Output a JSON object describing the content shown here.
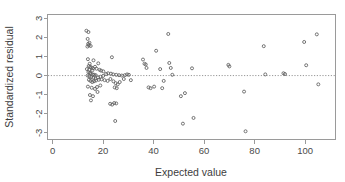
{
  "chart_data": {
    "type": "scatter",
    "title": "",
    "xlabel": "Expected value",
    "ylabel": "Standardized residual",
    "xlim": [
      -2,
      112
    ],
    "ylim": [
      -3.35,
      3.2
    ],
    "xticks": [
      0,
      20,
      40,
      60,
      80,
      100
    ],
    "yticks": [
      -3,
      -2,
      -1,
      0,
      1,
      2,
      3
    ],
    "xtick_labels": [
      "0",
      "20",
      "40",
      "60",
      "80",
      "100"
    ],
    "ytick_labels": [
      "-3",
      "-2",
      "-1",
      "0",
      "1",
      "2",
      "3"
    ],
    "grid": false,
    "legend": null,
    "reference_lines": [
      {
        "name": "zero-residual-line",
        "orientation": "horizontal",
        "y": 0,
        "style": "dotted"
      }
    ],
    "marker": {
      "shape": "open-circle",
      "radius": 1.5,
      "color": "#5d5d5d"
    },
    "points": [
      [
        13.4,
        2.35
      ],
      [
        14.2,
        2.28
      ],
      [
        13.9,
        1.92
      ],
      [
        14.6,
        1.72
      ],
      [
        14.1,
        1.66
      ],
      [
        14.4,
        1.58
      ],
      [
        13.8,
        1.52
      ],
      [
        15.1,
        1.55
      ],
      [
        14.0,
        0.86
      ],
      [
        16.2,
        0.8
      ],
      [
        18.1,
        0.64
      ],
      [
        14.7,
        0.62
      ],
      [
        14.3,
        0.5
      ],
      [
        14.9,
        0.46
      ],
      [
        15.4,
        0.42
      ],
      [
        16.0,
        0.38
      ],
      [
        13.6,
        0.34
      ],
      [
        14.5,
        0.3
      ],
      [
        15.8,
        0.28
      ],
      [
        16.8,
        0.46
      ],
      [
        17.4,
        0.36
      ],
      [
        18.6,
        0.3
      ],
      [
        19.2,
        0.26
      ],
      [
        20.1,
        0.22
      ],
      [
        14.2,
        0.18
      ],
      [
        14.8,
        0.14
      ],
      [
        15.2,
        0.1
      ],
      [
        15.9,
        0.06
      ],
      [
        16.5,
        0.04
      ],
      [
        17.1,
        0.02
      ],
      [
        13.9,
        0.0
      ],
      [
        14.6,
        -0.04
      ],
      [
        15.3,
        -0.08
      ],
      [
        16.1,
        -0.12
      ],
      [
        17.0,
        -0.16
      ],
      [
        18.0,
        -0.1
      ],
      [
        19.0,
        -0.06
      ],
      [
        20.0,
        -0.02
      ],
      [
        21.2,
        0.08
      ],
      [
        22.0,
        0.12
      ],
      [
        23.1,
        0.1
      ],
      [
        24.0,
        0.06
      ],
      [
        25.2,
        0.04
      ],
      [
        26.3,
        0.02
      ],
      [
        27.4,
        0.0
      ],
      [
        28.6,
        0.02
      ],
      [
        29.5,
        0.06
      ],
      [
        30.2,
        0.04
      ],
      [
        14.4,
        -0.22
      ],
      [
        15.0,
        -0.28
      ],
      [
        15.7,
        -0.34
      ],
      [
        16.4,
        -0.3
      ],
      [
        17.2,
        -0.26
      ],
      [
        18.3,
        -0.22
      ],
      [
        19.4,
        -0.2
      ],
      [
        20.6,
        -0.24
      ],
      [
        21.8,
        -0.28
      ],
      [
        22.9,
        -0.18
      ],
      [
        24.1,
        -0.3
      ],
      [
        25.0,
        -0.4
      ],
      [
        25.8,
        -0.46
      ],
      [
        26.6,
        -0.34
      ],
      [
        14.0,
        -0.58
      ],
      [
        15.5,
        -0.64
      ],
      [
        16.8,
        -0.7
      ],
      [
        17.6,
        -0.6
      ],
      [
        18.9,
        -0.52
      ],
      [
        24.6,
        -0.62
      ],
      [
        25.4,
        -0.66
      ],
      [
        14.8,
        -1.02
      ],
      [
        16.0,
        -1.08
      ],
      [
        17.8,
        -0.86
      ],
      [
        15.2,
        -1.3
      ],
      [
        22.8,
        -1.48
      ],
      [
        23.6,
        -1.52
      ],
      [
        24.4,
        -1.44
      ],
      [
        25.2,
        -1.46
      ],
      [
        24.8,
        -2.38
      ],
      [
        23.5,
        0.96
      ],
      [
        28.2,
        -0.18
      ],
      [
        31.0,
        -0.24
      ],
      [
        35.8,
        0.84
      ],
      [
        36.4,
        0.62
      ],
      [
        36.9,
        0.58
      ],
      [
        37.2,
        0.4
      ],
      [
        38.0,
        -0.62
      ],
      [
        38.8,
        -0.66
      ],
      [
        40.2,
        -0.58
      ],
      [
        41.0,
        1.3
      ],
      [
        42.6,
        0.34
      ],
      [
        43.4,
        -0.66
      ],
      [
        44.0,
        -0.28
      ],
      [
        45.8,
        2.18
      ],
      [
        46.2,
        0.66
      ],
      [
        46.8,
        0.4
      ],
      [
        47.4,
        0.04
      ],
      [
        50.8,
        -1.08
      ],
      [
        51.6,
        -2.52
      ],
      [
        52.4,
        -0.92
      ],
      [
        55.2,
        0.38
      ],
      [
        55.8,
        -2.22
      ],
      [
        69.6,
        0.56
      ],
      [
        70.0,
        0.48
      ],
      [
        75.8,
        -0.84
      ],
      [
        76.4,
        -2.92
      ],
      [
        83.6,
        1.54
      ],
      [
        84.2,
        0.06
      ],
      [
        91.4,
        0.12
      ],
      [
        92.0,
        0.08
      ],
      [
        99.6,
        1.76
      ],
      [
        100.4,
        0.54
      ],
      [
        104.6,
        2.16
      ],
      [
        105.2,
        -0.46
      ]
    ]
  },
  "axes": {
    "x_axis_name": "x-axis",
    "y_axis_name": "y-axis"
  }
}
